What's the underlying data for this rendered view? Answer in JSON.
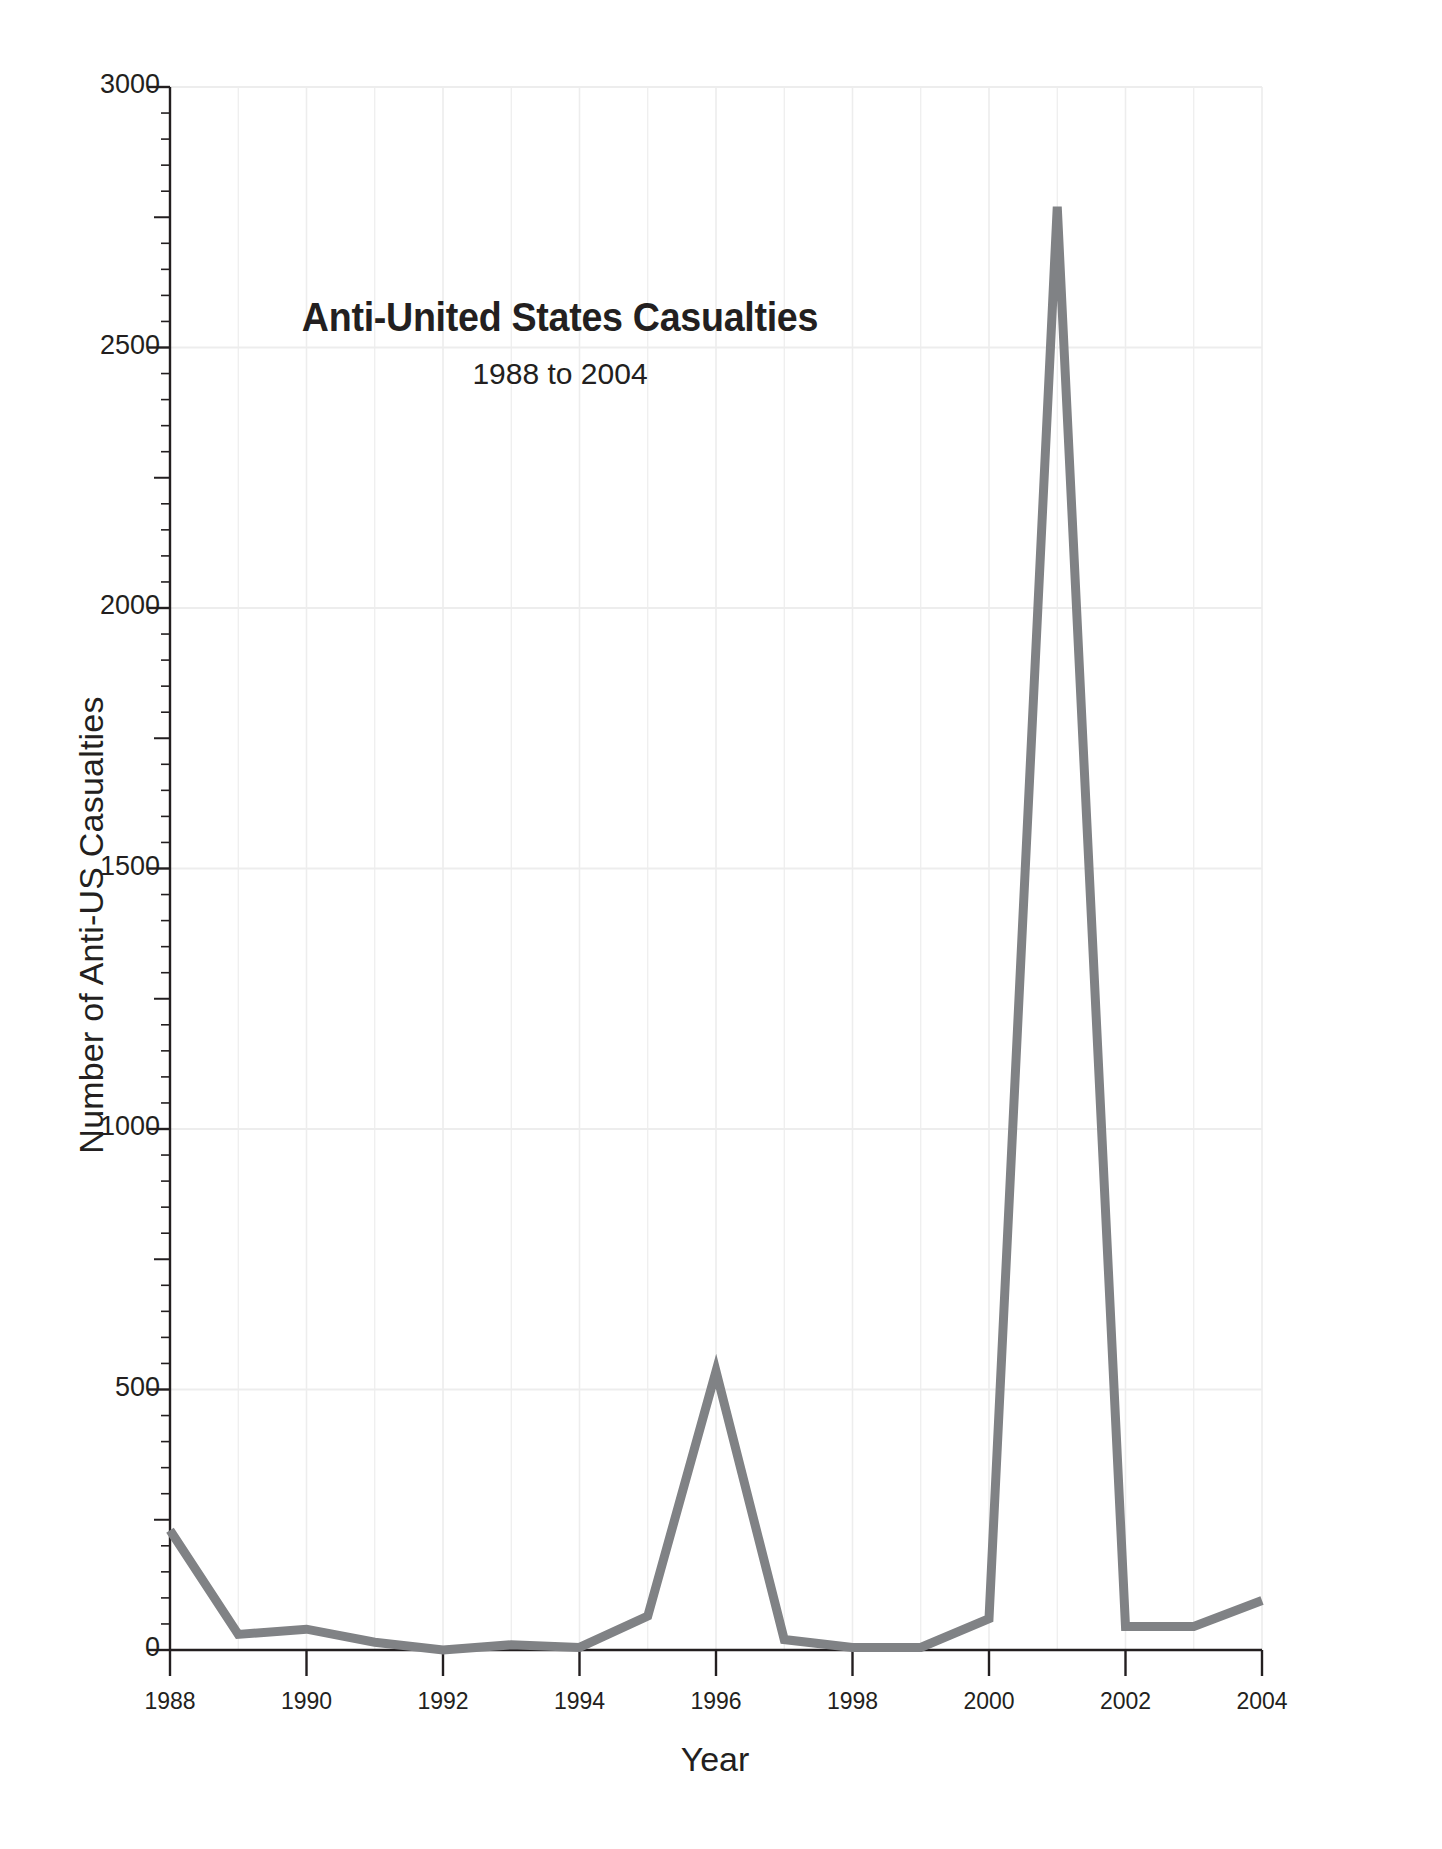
{
  "chart_data": {
    "type": "line",
    "title": "Anti-United States Casualties",
    "subtitle": "1988 to 2004",
    "xlabel": "Year",
    "ylabel": "Number of Anti-US Casualties",
    "x": [
      1988,
      1989,
      1990,
      1991,
      1992,
      1993,
      1994,
      1995,
      1996,
      1997,
      1998,
      1999,
      2000,
      2001,
      2002,
      2003,
      2004
    ],
    "values": [
      230,
      30,
      40,
      15,
      0,
      10,
      5,
      65,
      535,
      20,
      5,
      5,
      60,
      2770,
      45,
      45,
      95
    ],
    "series": [
      {
        "name": "Anti-US Casualties",
        "values": [
          230,
          30,
          40,
          15,
          0,
          10,
          5,
          65,
          535,
          20,
          5,
          5,
          60,
          2770,
          45,
          45,
          95
        ],
        "color": "#808285"
      }
    ],
    "xlim": [
      1988,
      2004
    ],
    "ylim": [
      0,
      3000
    ],
    "ytick_labels": [
      "0",
      "500",
      "1000",
      "1500",
      "2000",
      "2500",
      "3000"
    ],
    "ytick_values": [
      0,
      500,
      1000,
      1500,
      2000,
      2500,
      3000
    ],
    "ytick_minor_step": 50,
    "xtick_labels": [
      "1988",
      "1990",
      "1992",
      "1994",
      "1996",
      "1998",
      "2000",
      "2002",
      "2004"
    ],
    "xtick_values": [
      1988,
      1990,
      1992,
      1994,
      1996,
      1998,
      2000,
      2002,
      2004
    ],
    "grid": true,
    "grid_color": "#ededed",
    "axis_color": "#231f20",
    "legend": false,
    "legend_position": "none",
    "background": "#ffffff"
  }
}
